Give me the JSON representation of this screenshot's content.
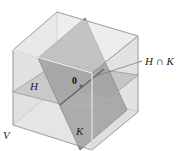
{
  "diagram": {
    "title": "",
    "labels": {
      "space": "V",
      "plane_h": "H",
      "plane_k": "K",
      "intersection": "H ∩ K",
      "origin": "0"
    },
    "colors": {
      "cube_face_light": "#e6e6e6",
      "cube_face_mid": "#d4d4d4",
      "cube_edge": "#9a9a9a",
      "plane_h": "#a9a9a9",
      "plane_k": "#7a7a7a",
      "intersection_line": "#222222",
      "background": "#ffffff"
    }
  }
}
